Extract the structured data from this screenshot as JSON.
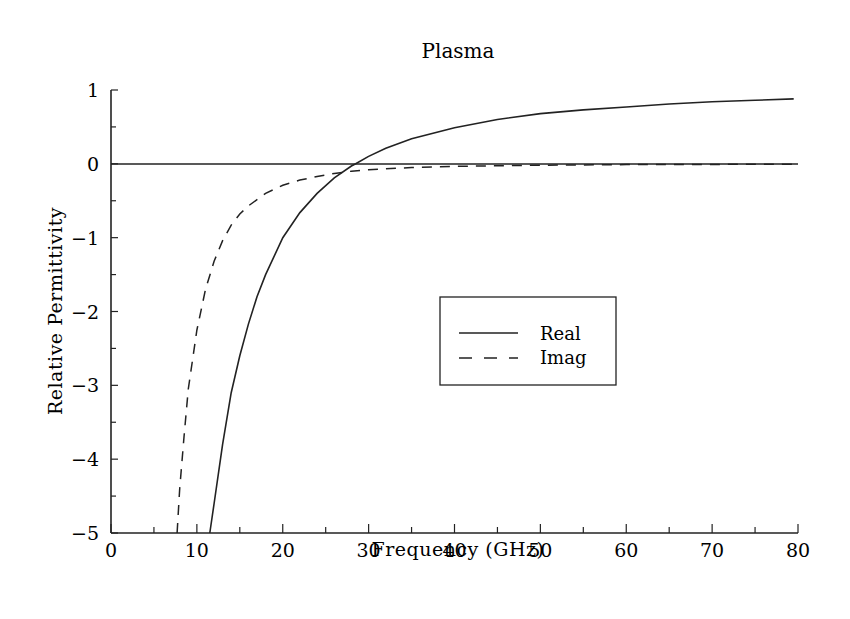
{
  "chart_data": {
    "type": "line",
    "title": "Plasma",
    "xlabel": "Frequency (GHz)",
    "ylabel": "Relative Permittivity",
    "xlim": [
      0,
      80
    ],
    "ylim": [
      -5,
      1
    ],
    "xticks": [
      "0",
      "10",
      "20",
      "30",
      "40",
      "50",
      "60",
      "70",
      "80"
    ],
    "yticks": [
      "1",
      "0",
      "-1",
      "-2",
      "-3",
      "-4",
      "-5"
    ],
    "grid": false,
    "legend": {
      "position": "center-right",
      "entries": [
        "Real",
        "Imag"
      ]
    },
    "zero_line": true,
    "series": [
      {
        "name": "Real",
        "style": "solid",
        "x": [
          11.5,
          12,
          13,
          14,
          15,
          16,
          17,
          18,
          20,
          22,
          24,
          26,
          28,
          28.5,
          30,
          32,
          35,
          40,
          45,
          50,
          55,
          60,
          65,
          70,
          75,
          79.5
        ],
        "y": [
          -5.0,
          -4.6,
          -3.8,
          -3.1,
          -2.6,
          -2.17,
          -1.8,
          -1.5,
          -1.0,
          -0.66,
          -0.4,
          -0.19,
          -0.03,
          0.0,
          0.1,
          0.21,
          0.34,
          0.49,
          0.6,
          0.68,
          0.73,
          0.77,
          0.81,
          0.84,
          0.86,
          0.88
        ]
      },
      {
        "name": "Imag",
        "style": "dashed",
        "x": [
          7.7,
          8,
          8.5,
          9,
          10,
          11,
          12,
          13,
          14,
          15,
          16,
          18,
          20,
          22,
          24,
          26,
          28,
          30,
          35,
          40,
          50,
          60,
          70,
          79.5
        ],
        "y": [
          -5.0,
          -4.4,
          -3.7,
          -3.05,
          -2.25,
          -1.7,
          -1.32,
          -1.04,
          -0.83,
          -0.68,
          -0.57,
          -0.4,
          -0.29,
          -0.22,
          -0.17,
          -0.13,
          -0.1,
          -0.08,
          -0.05,
          -0.035,
          -0.018,
          -0.01,
          -0.007,
          -0.005
        ]
      }
    ]
  }
}
